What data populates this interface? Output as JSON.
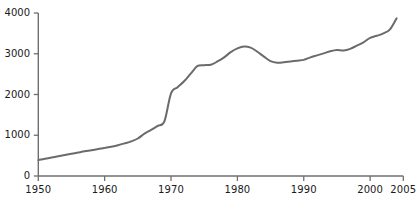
{
  "chart_data": {
    "type": "line",
    "title": "",
    "subtitle": "",
    "xlabel": "",
    "ylabel": "",
    "xlim": [
      1950,
      2005
    ],
    "ylim": [
      0,
      4000
    ],
    "grid": false,
    "legend": "none",
    "axis_color": "#6f6f6f",
    "line_color": "#6b6b6b",
    "line_width": 2,
    "text_color": "#1a1a1a",
    "x_ticks": [
      1950,
      1960,
      1970,
      1980,
      1990,
      2000,
      2005
    ],
    "x_tick_labels": [
      "1950",
      "1960",
      "1970",
      "1980",
      "1990",
      "2000",
      "2005"
    ],
    "y_ticks": [
      0,
      1000,
      2000,
      3000,
      4000
    ],
    "y_tick_labels": [
      "0",
      "1000",
      "2000",
      "3000",
      "4000"
    ],
    "series": [
      {
        "name": "series-1",
        "x": [
          1950,
          1951,
          1952,
          1953,
          1954,
          1955,
          1956,
          1957,
          1958,
          1959,
          1960,
          1961,
          1962,
          1963,
          1964,
          1965,
          1966,
          1967,
          1968,
          1969,
          1970,
          1971,
          1972,
          1973,
          1974,
          1975,
          1976,
          1977,
          1978,
          1979,
          1980,
          1981,
          1982,
          1983,
          1984,
          1985,
          1986,
          1987,
          1988,
          1989,
          1990,
          1991,
          1992,
          1993,
          1994,
          1995,
          1996,
          1997,
          1998,
          1999,
          2000,
          2001,
          2002,
          2003,
          2004
        ],
        "values": [
          390,
          425,
          455,
          485,
          515,
          545,
          575,
          605,
          630,
          660,
          690,
          720,
          755,
          800,
          850,
          920,
          1040,
          1130,
          1230,
          1340,
          2030,
          2180,
          2330,
          2520,
          2700,
          2720,
          2730,
          2810,
          2910,
          3040,
          3130,
          3180,
          3150,
          3050,
          2930,
          2820,
          2780,
          2790,
          2810,
          2830,
          2850,
          2910,
          2960,
          3010,
          3060,
          3090,
          3080,
          3120,
          3200,
          3280,
          3390,
          3440,
          3500,
          3600,
          3870
        ]
      }
    ],
    "notes": [
      "Monotonic rise 1950-1974 with a steeper slope starting around 1966",
      "Plateau around 1974-1976",
      "Peak near 1981 at about 3180",
      "Trough near 1986 at about 2780",
      "Steady recovery and rise to about 3870 by 2004"
    ]
  },
  "axes": {
    "x_axis_name": "year-axis",
    "y_axis_name": "value-axis"
  }
}
